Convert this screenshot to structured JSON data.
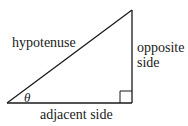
{
  "diagram": {
    "type": "right-triangle",
    "labels": {
      "hypotenuse": "hypotenuse",
      "opposite_line1": "opposite",
      "opposite_line2": "side",
      "adjacent": "adjacent side",
      "angle": "θ"
    },
    "colors": {
      "stroke": "#1a1a1a",
      "background": "#ffffff"
    }
  }
}
